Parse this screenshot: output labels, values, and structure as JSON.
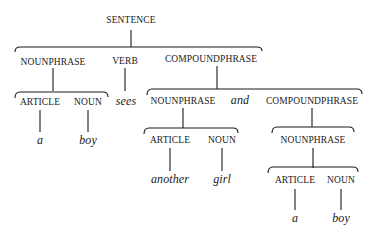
{
  "diagram": {
    "type": "parse-tree",
    "root": {
      "label": "SENTENCE",
      "children": [
        {
          "label": "NOUNPHRASE",
          "children": [
            {
              "label": "ARTICLE",
              "children": [
                {
                  "word": "a"
                }
              ]
            },
            {
              "label": "NOUN",
              "children": [
                {
                  "word": "boy"
                }
              ]
            }
          ]
        },
        {
          "label": "VERB",
          "children": [
            {
              "word": "sees"
            }
          ]
        },
        {
          "label": "COMPOUNDPHRASE",
          "children": [
            {
              "label": "NOUNPHRASE",
              "children": [
                {
                  "label": "ARTICLE",
                  "children": [
                    {
                      "word": "another"
                    }
                  ]
                },
                {
                  "label": "NOUN",
                  "children": [
                    {
                      "word": "girl"
                    }
                  ]
                }
              ]
            },
            {
              "word": "and"
            },
            {
              "label": "COMPOUNDPHRASE",
              "children": [
                {
                  "label": "NOUNPHRASE",
                  "children": [
                    {
                      "label": "ARTICLE",
                      "children": [
                        {
                          "word": "a"
                        }
                      ]
                    },
                    {
                      "label": "NOUN",
                      "children": [
                        {
                          "word": "boy"
                        }
                      ]
                    }
                  ]
                }
              ]
            }
          ]
        }
      ]
    }
  },
  "nodes": {
    "sentence": "SENTENCE",
    "np1": "NOUNPHRASE",
    "verb": "VERB",
    "cp1": "COMPOUNDPHRASE",
    "art1": "ARTICLE",
    "noun1": "NOUN",
    "w_a1": "a",
    "w_boy1": "boy",
    "w_sees": "sees",
    "np2": "NOUNPHRASE",
    "w_and": "and",
    "cp2": "COMPOUNDPHRASE",
    "art2": "ARTICLE",
    "noun2": "NOUN",
    "w_another": "another",
    "w_girl": "girl",
    "np3": "NOUNPHRASE",
    "art3": "ARTICLE",
    "noun3": "NOUN",
    "w_a2": "a",
    "w_boy2": "boy"
  }
}
